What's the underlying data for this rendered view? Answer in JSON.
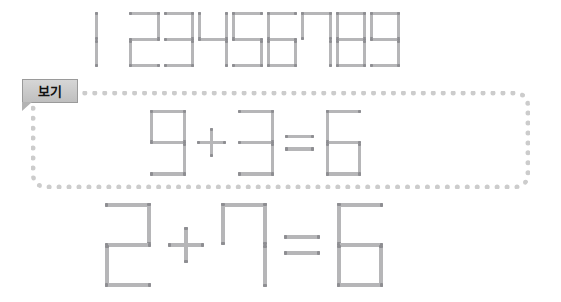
{
  "page": {
    "background_color": "#ffffff",
    "stick_color": "#b6b6b8",
    "stick_tip_color": "#8e8e92"
  },
  "reference_row": {
    "name": "seven-segment digit reference",
    "digits": [
      "1",
      "2",
      "3",
      "4",
      "5",
      "6",
      "7",
      "8",
      "9"
    ],
    "scale": 0.66
  },
  "example_tab": {
    "label": "보기",
    "background_color": "#c9c9c9",
    "text_color": "#111111",
    "border_color": "#9a9a9a"
  },
  "example_box": {
    "border_style": "dotted",
    "border_color": "#cccccc",
    "corner_radius_px": 14
  },
  "example_equation": {
    "name": "example-equation",
    "expression": "9 + 3 = 6",
    "tokens": [
      "9",
      "+",
      "3",
      "=",
      "6"
    ],
    "left_operand": "9",
    "operator": "+",
    "right_operand": "3",
    "equals": "=",
    "result": "6",
    "scale": 0.78
  },
  "problem_equation": {
    "name": "problem-equation",
    "expression": "2 + 7 = 6",
    "tokens": [
      "2",
      "+",
      "7",
      "=",
      "6"
    ],
    "left_operand": "2",
    "operator": "+",
    "right_operand": "7",
    "equals": "=",
    "result": "6",
    "scale": 1.0
  }
}
